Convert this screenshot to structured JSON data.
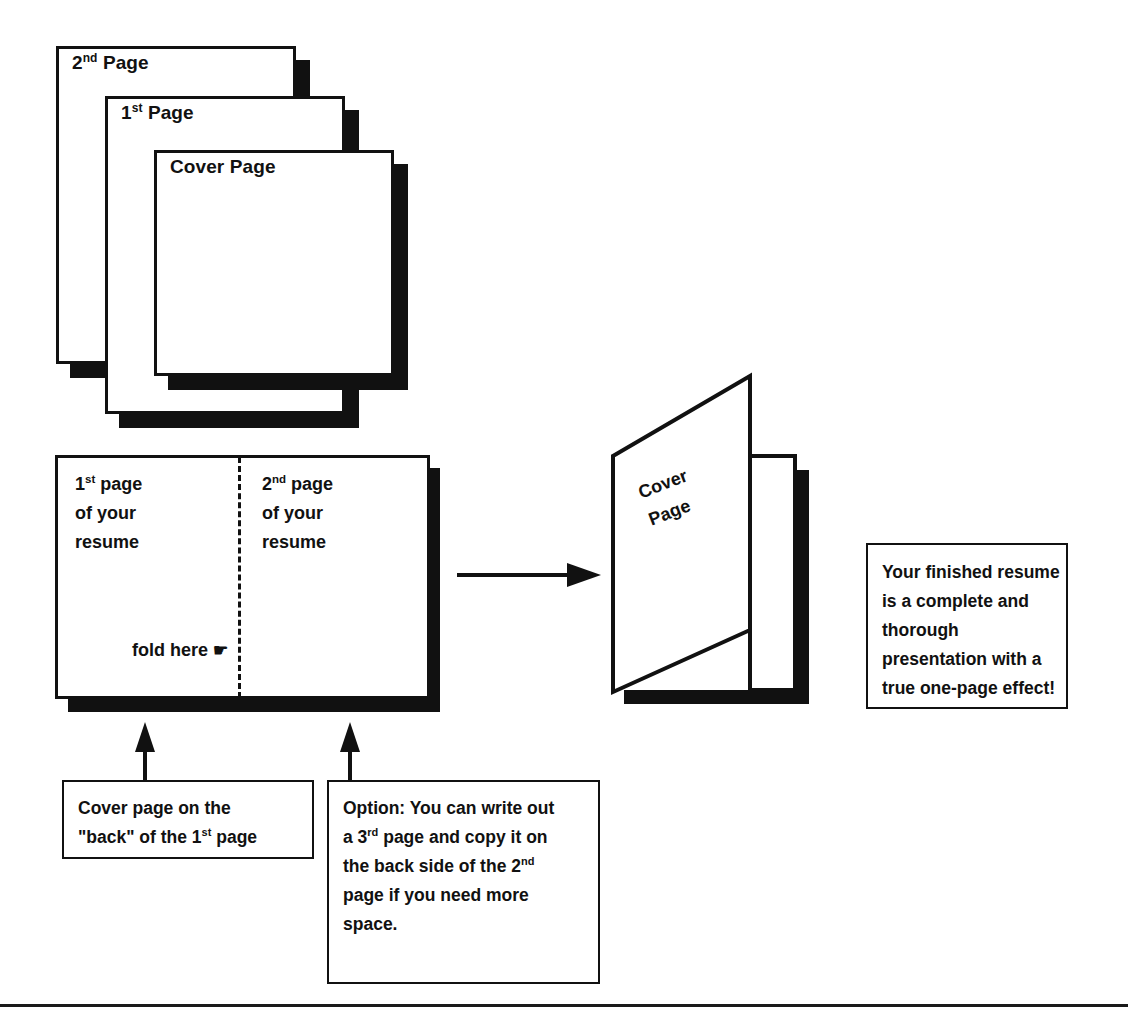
{
  "diagram": {
    "stroke_color": "#111111",
    "background_color": "#ffffff"
  },
  "page_stack": {
    "sheets": [
      {
        "label_prefix": "2",
        "label_sup": "nd",
        "label_rest": " Page",
        "name": "second-page-sheet"
      },
      {
        "label_prefix": "1",
        "label_sup": "st",
        "label_rest": " Page",
        "name": "first-page-sheet"
      },
      {
        "label_prefix": "Cover Page",
        "label_sup": "",
        "label_rest": "",
        "name": "cover-page-sheet"
      }
    ],
    "labels": {
      "second": "2",
      "second_sup": "nd",
      "second_rest": " Page",
      "first": "1",
      "first_sup": "st",
      "first_rest": " Page",
      "cover": "Cover Page"
    }
  },
  "open_resume": {
    "left_column": {
      "line1_num": "1",
      "line1_sup": "st",
      "line1_rest": " page",
      "line2": "of your",
      "line3": "resume"
    },
    "right_column": {
      "line1_num": "2",
      "line1_sup": "nd",
      "line1_rest": " page",
      "line2": "of your",
      "line3": "resume"
    },
    "fold_label": "fold here",
    "fold_icon": "☛",
    "fold_icon_name": "pointing-hand-icon"
  },
  "booklet": {
    "cover_line1": "Cover",
    "cover_line2": "Page"
  },
  "notes": {
    "finished": {
      "line1": "Your finished resume",
      "line2": "is a complete and",
      "line3": "thorough",
      "line4": "presentation with a",
      "line5": "true one-page effect!"
    },
    "back_cover": {
      "line1": "Cover page on the",
      "line2_pre": "\"back\" of the 1",
      "line2_sup": "st",
      "line2_post": " page"
    },
    "option": {
      "line1": "Option: You can write out",
      "line2_pre": "a 3",
      "line2_sup": "rd",
      "line2_post": " page and copy it on",
      "line3_pre": "the back side of the  2",
      "line3_sup": "nd",
      "line3_post": "",
      "line4": "page if you need more",
      "line5": "space."
    }
  },
  "arrows": {
    "transform_arrow_name": "right-arrow-to-booklet",
    "callout_arrow_left_name": "up-arrow-back-cover",
    "callout_arrow_right_name": "up-arrow-option"
  }
}
